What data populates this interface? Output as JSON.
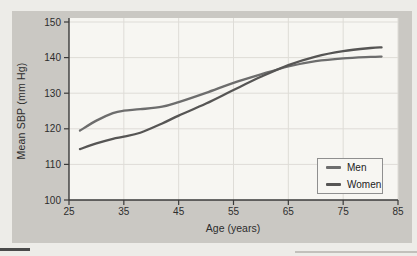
{
  "figure": {
    "panel_background": "#cac8c3",
    "plot_background": "#f7f6f2",
    "gridline_color": "#dedcd7",
    "axis_color": "#3a3a3a",
    "text_color": "#2d2d2d"
  },
  "chart_data": {
    "type": "line",
    "title": "",
    "xlabel": "Age (years)",
    "ylabel": "Mean SBP (mm Hg)",
    "xlim": [
      25,
      85
    ],
    "ylim": [
      100,
      150
    ],
    "x_ticks": [
      25,
      35,
      45,
      55,
      65,
      75,
      85
    ],
    "y_ticks": [
      100,
      110,
      120,
      130,
      140,
      150
    ],
    "grid": true,
    "legend_position": "lower right",
    "x": [
      27,
      30,
      33,
      35,
      38,
      42,
      45,
      50,
      55,
      60,
      65,
      70,
      75,
      80,
      82
    ],
    "series": [
      {
        "name": "Men",
        "color": "#6d6d6d",
        "values": [
          119.5,
          122.3,
          124.4,
          125.1,
          125.5,
          126.2,
          127.5,
          130.1,
          132.9,
          135.3,
          137.5,
          139.0,
          139.8,
          140.2,
          140.3
        ]
      },
      {
        "name": "Women",
        "color": "#565554",
        "values": [
          114.3,
          115.9,
          117.2,
          117.8,
          118.9,
          121.5,
          123.7,
          127.1,
          130.9,
          134.6,
          137.9,
          140.3,
          141.8,
          142.7,
          142.9
        ]
      }
    ]
  }
}
